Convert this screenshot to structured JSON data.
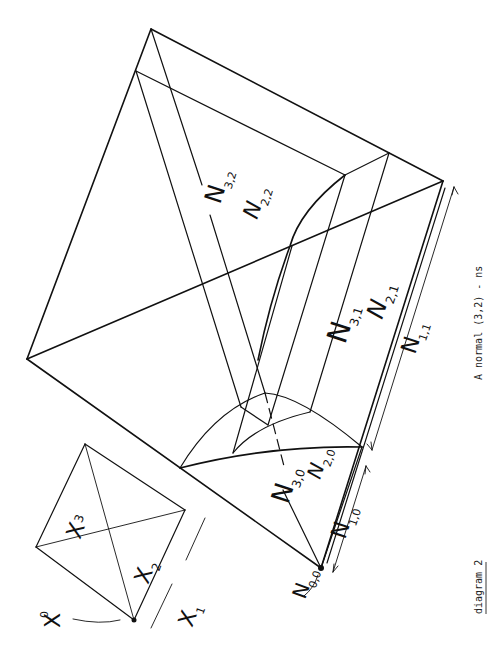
{
  "figure": {
    "title": "diagram 2",
    "caption": "A normal (3,2) - ns",
    "rotation_deg": 90
  },
  "small_simplex": {
    "labels": [
      {
        "id": "x0",
        "base": "X",
        "sub": "0",
        "sup_style": true
      },
      {
        "id": "x1",
        "base": "X",
        "sub": "1"
      },
      {
        "id": "x2",
        "base": "X",
        "sub": "2"
      },
      {
        "id": "x3",
        "base": "X",
        "sub": "3"
      }
    ]
  },
  "large_figure": {
    "labels": [
      {
        "id": "n00",
        "base": "N",
        "sub": "0,0"
      },
      {
        "id": "n10",
        "base": "N",
        "sub": "1,0"
      },
      {
        "id": "n11",
        "base": "N",
        "sub": "1,1"
      },
      {
        "id": "n20",
        "base": "N",
        "sub": "2,0"
      },
      {
        "id": "n21",
        "base": "N",
        "sub": "2,1"
      },
      {
        "id": "n22",
        "base": "N",
        "sub": "2,2"
      },
      {
        "id": "n30",
        "base": "N",
        "sub": "3,0"
      },
      {
        "id": "n31",
        "base": "N",
        "sub": "3,1"
      },
      {
        "id": "n32",
        "base": "N",
        "sub": "3,2"
      }
    ]
  },
  "colors": {
    "ink": "#111111",
    "paper": "#ffffff"
  }
}
